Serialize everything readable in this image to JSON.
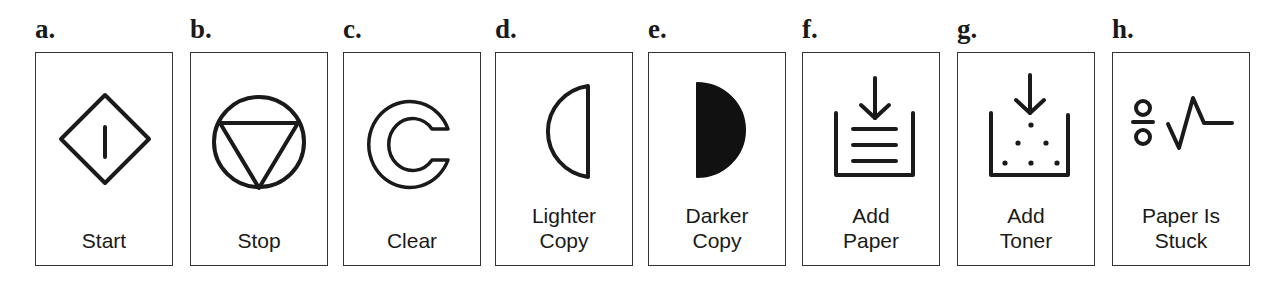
{
  "figure": {
    "panels": [
      {
        "letter": "a.",
        "icon": "start-icon",
        "label_lines": [
          "Start"
        ]
      },
      {
        "letter": "b.",
        "icon": "stop-icon",
        "label_lines": [
          "Stop"
        ]
      },
      {
        "letter": "c.",
        "icon": "clear-icon",
        "label_lines": [
          "Clear"
        ]
      },
      {
        "letter": "d.",
        "icon": "lighter-copy-icon",
        "label_lines": [
          "Lighter",
          "Copy"
        ]
      },
      {
        "letter": "e.",
        "icon": "darker-copy-icon",
        "label_lines": [
          "Darker",
          "Copy"
        ]
      },
      {
        "letter": "f.",
        "icon": "add-paper-icon",
        "label_lines": [
          "Add",
          "Paper"
        ]
      },
      {
        "letter": "g.",
        "icon": "add-toner-icon",
        "label_lines": [
          "Add",
          "Toner"
        ]
      },
      {
        "letter": "h.",
        "icon": "paper-jam-icon",
        "label_lines": [
          "Paper Is",
          "Stuck"
        ]
      }
    ],
    "colors": {
      "ink": "#1a1a1a",
      "border": "#333333",
      "background": "#ffffff"
    }
  }
}
